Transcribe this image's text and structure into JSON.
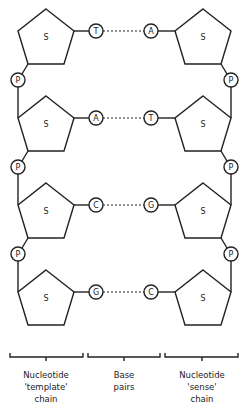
{
  "diagram": {
    "sugar_label": "S",
    "phosphate_label": "P",
    "rows": [
      {
        "left_base": "T",
        "right_base": "A"
      },
      {
        "left_base": "A",
        "right_base": "T"
      },
      {
        "left_base": "C",
        "right_base": "G"
      },
      {
        "left_base": "G",
        "right_base": "C"
      }
    ],
    "brackets": [
      {
        "lines": [
          "Nucleotide",
          "'template'",
          "chain"
        ]
      },
      {
        "lines": [
          "Base",
          "pairs"
        ]
      },
      {
        "lines": [
          "Nucleotide",
          "'sense'",
          "chain"
        ]
      }
    ],
    "colors": {
      "stroke": "#222222",
      "background": "#ffffff"
    }
  }
}
